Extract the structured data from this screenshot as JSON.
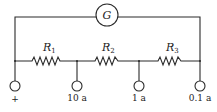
{
  "diagram": {
    "type": "circuit-schematic",
    "galvanometer": {
      "label": "G"
    },
    "resistors": [
      {
        "id": "R1",
        "label": "R",
        "subscript": "1"
      },
      {
        "id": "R2",
        "label": "R",
        "subscript": "2"
      },
      {
        "id": "R3",
        "label": "R",
        "subscript": "3"
      }
    ],
    "terminals": [
      {
        "label": "+"
      },
      {
        "label": "10 a"
      },
      {
        "label": "1 a"
      },
      {
        "label": "0.1 a"
      }
    ],
    "colors": {
      "ink": "#2a2a2a",
      "background": "#ffffff"
    }
  }
}
